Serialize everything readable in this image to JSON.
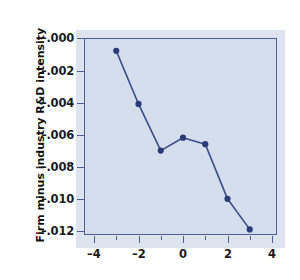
{
  "chart_data": {
    "type": "line",
    "title": "",
    "subtitle": "",
    "xlabel": "",
    "ylabel": "Firm minus industry R&D intensity",
    "x": [
      -3,
      -2,
      -1,
      0,
      1,
      2,
      3
    ],
    "values": [
      -0.0008,
      -0.0041,
      -0.007,
      -0.0062,
      -0.0066,
      -0.01,
      -0.0119
    ],
    "series": [
      {
        "name": "Firm minus industry R&D intensity",
        "values": [
          -0.0008,
          -0.0041,
          -0.007,
          -0.0062,
          -0.0066,
          -0.01,
          -0.0119
        ]
      }
    ],
    "xlim": [
      -4.6,
      4.6
    ],
    "ylim": [
      -0.0125,
      0.0002
    ],
    "xticks": [
      -4,
      -2,
      0,
      2,
      4
    ],
    "xtick_labels": [
      "–4",
      "–2",
      "0",
      "2",
      "4"
    ],
    "xticks_minor": [
      -3,
      -1,
      1,
      3
    ],
    "yticks": [
      0.0,
      -0.002,
      -0.004,
      -0.006,
      -0.008,
      -0.01,
      -0.012
    ],
    "ytick_labels": [
      "–.000",
      "–.002",
      "–.004",
      "–.006",
      "–.008",
      "–.010",
      "–.012"
    ],
    "grid": false,
    "legend": null,
    "legend_position": "none",
    "annotations": [],
    "marker": "filled-circle",
    "line_color": "#3c4d8c",
    "marker_color": "#2b3a78",
    "plot_background": "#cdd8ea",
    "frame_color": "#4d5e96",
    "text_color": "#1b1b1b"
  }
}
